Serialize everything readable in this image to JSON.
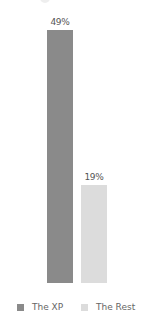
{
  "chart_data": {
    "type": "bar",
    "title": "",
    "xlabel": "",
    "ylabel": "",
    "categories": [
      "The XP",
      "The Rest"
    ],
    "values": [
      49,
      19
    ],
    "value_labels": [
      "49%",
      "19%"
    ],
    "colors": [
      "#8a8a8a",
      "#dcdcdc"
    ],
    "ylim": [
      0,
      49
    ],
    "grid": false,
    "legend_position": "bottom"
  },
  "legend": {
    "items": [
      {
        "label": "The XP",
        "color": "#8a8a8a"
      },
      {
        "label": "The Rest",
        "color": "#dcdcdc"
      }
    ]
  }
}
